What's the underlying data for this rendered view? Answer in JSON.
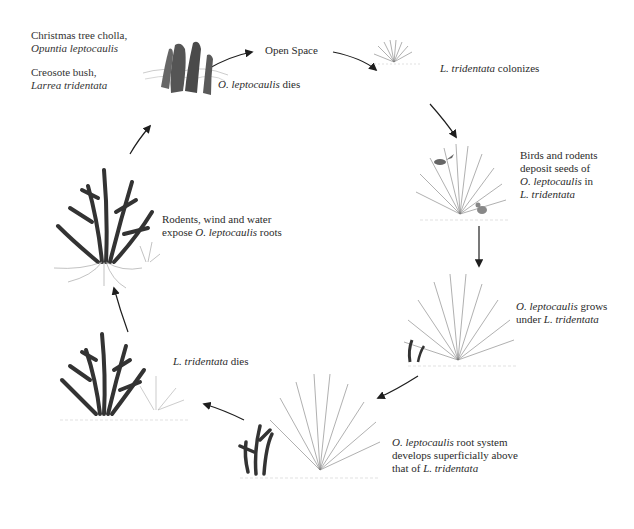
{
  "legend": [
    {
      "common": "Christmas tree cholla,",
      "scientific": "Opuntia leptocaulis"
    },
    {
      "common": "Creosote bush,",
      "scientific": "Larrea tridentata"
    }
  ],
  "stages": [
    {
      "id": "open-space",
      "parts": [
        {
          "t": "Open Space",
          "i": false
        }
      ]
    },
    {
      "id": "l-tridentata-colonizes",
      "parts": [
        {
          "t": "L. tridentata",
          "i": true
        },
        {
          "t": " colonizes",
          "i": false
        }
      ]
    },
    {
      "id": "birds-rodents-deposit",
      "lines": [
        [
          {
            "t": "Birds and rodents",
            "i": false
          }
        ],
        [
          {
            "t": "deposit seeds of",
            "i": false
          }
        ],
        [
          {
            "t": "O. leptocaulis",
            "i": true
          },
          {
            "t": " in",
            "i": false
          }
        ],
        [
          {
            "t": "L. tridentata",
            "i": true
          }
        ]
      ]
    },
    {
      "id": "o-leptocaulis-grows",
      "lines": [
        [
          {
            "t": "O. leptocaulis",
            "i": true
          },
          {
            "t": " grows",
            "i": false
          }
        ],
        [
          {
            "t": "under ",
            "i": false
          },
          {
            "t": "L. tridentata",
            "i": true
          }
        ]
      ]
    },
    {
      "id": "root-system-develops",
      "lines": [
        [
          {
            "t": "O. leptocaulis",
            "i": true
          },
          {
            "t": " root system",
            "i": false
          }
        ],
        [
          {
            "t": "develops superficially above",
            "i": false
          }
        ],
        [
          {
            "t": "that of ",
            "i": false
          },
          {
            "t": "L. tridentata",
            "i": true
          }
        ]
      ]
    },
    {
      "id": "l-tridentata-dies",
      "parts": [
        {
          "t": "L. tridentata",
          "i": true
        },
        {
          "t": " dies",
          "i": false
        }
      ]
    },
    {
      "id": "roots-exposed",
      "lines": [
        [
          {
            "t": "Rodents, wind and water",
            "i": false
          }
        ],
        [
          {
            "t": "expose ",
            "i": false
          },
          {
            "t": "O. leptocaulis",
            "i": true
          },
          {
            "t": " roots",
            "i": false
          }
        ]
      ]
    },
    {
      "id": "o-leptocaulis-dies",
      "parts": [
        {
          "t": "O. leptocaulis",
          "i": true
        },
        {
          "t": " dies",
          "i": false
        }
      ]
    }
  ],
  "colors": {
    "cholla": "#3c3c3c",
    "creosote": "#8a8a8a",
    "arrow": "#1e1e1e",
    "text": "#2b2b2b"
  }
}
